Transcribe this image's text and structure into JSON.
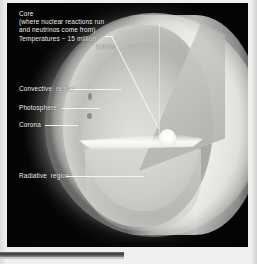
{
  "figure": {
    "plate_background": "#050505",
    "label_color": "#f2f2ef",
    "page_color": "#e8e8e6"
  },
  "labels": {
    "core": {
      "line1": "Core",
      "line2": "(where nuclear reactions run",
      "line3": "and neutrinos come from)",
      "line4": "Temperatures ~ 15 million",
      "line5": "kelvins"
    },
    "convective": "Convective  region",
    "photosphere": "Photosphere",
    "corona": "Corona",
    "radiative": "Radiative  region"
  },
  "regions": [
    {
      "name": "corona",
      "tone": "outer diffuse glow"
    },
    {
      "name": "photosphere",
      "tone": "bright visible surface"
    },
    {
      "name": "convective-region",
      "tone": "mid grey shell"
    },
    {
      "name": "radiative-region",
      "tone": "light inner shell"
    },
    {
      "name": "core",
      "tone": "bright white nugget",
      "temperature": "~ 15 million kelvins"
    }
  ]
}
